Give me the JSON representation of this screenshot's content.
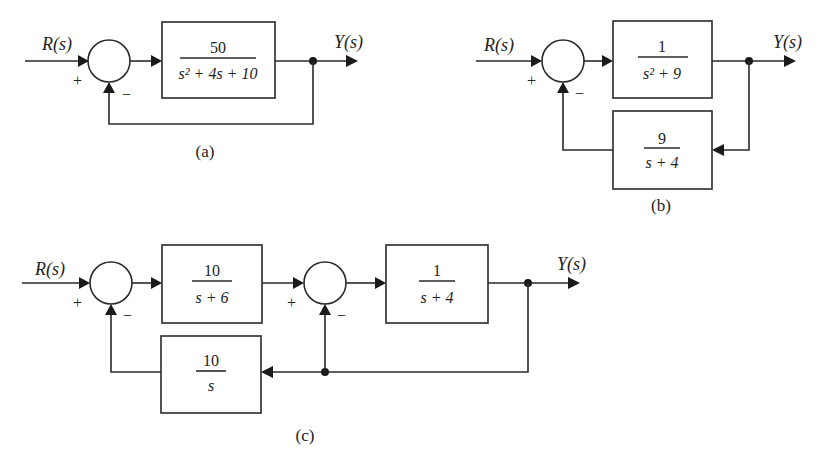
{
  "diagrams": {
    "a": {
      "caption": "(a)",
      "input_label": "R(s)",
      "output_label": "Y(s)",
      "sum_plus": "+",
      "sum_minus": "−",
      "forward_block": {
        "numerator": "50",
        "denominator": "s² + 4s + 10"
      },
      "feedback": "unity"
    },
    "b": {
      "caption": "(b)",
      "input_label": "R(s)",
      "output_label": "Y(s)",
      "sum_plus": "+",
      "sum_minus": "−",
      "forward_block": {
        "numerator": "1",
        "denominator": "s² + 9"
      },
      "feedback_block": {
        "numerator": "9",
        "denominator": "s + 4"
      }
    },
    "c": {
      "caption": "(c)",
      "input_label": "R(s)",
      "output_label": "Y(s)",
      "sum1_plus": "+",
      "sum1_minus": "−",
      "sum2_plus": "+",
      "sum2_minus": "−",
      "forward_block_1": {
        "numerator": "10",
        "denominator": "s + 6"
      },
      "forward_block_2": {
        "numerator": "1",
        "denominator": "s + 4"
      },
      "feedback_block": {
        "numerator": "10",
        "denominator": "s"
      }
    }
  }
}
